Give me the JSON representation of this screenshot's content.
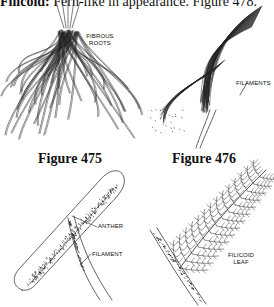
{
  "header": {
    "term": "Filicoid:",
    "definition": " Fern-like in appearance.  Figure 478."
  },
  "figures": [
    {
      "caption": "Figure 475",
      "labels": [
        "FIBROUS",
        "ROOTS"
      ],
      "subject": "fibrous-roots"
    },
    {
      "caption": "Figure 476",
      "labels": [
        "FILAMENTS"
      ],
      "subject": "filaments"
    },
    {
      "caption": "",
      "labels": [
        "ANTHER",
        "FILAMENT"
      ],
      "subject": "anther-and-filament"
    },
    {
      "caption": "",
      "labels": [
        "FILICOID",
        "LEAF"
      ],
      "subject": "filicoid-leaf"
    }
  ]
}
